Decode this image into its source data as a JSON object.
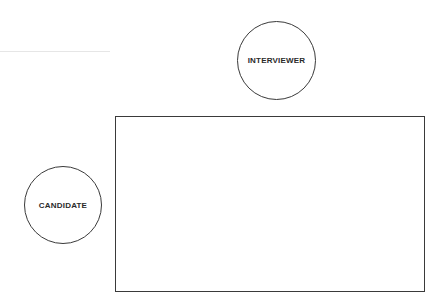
{
  "diagram": {
    "interviewer": {
      "label": "INTERVIEWER"
    },
    "candidate": {
      "label": "CANDIDATE"
    },
    "table": {
      "label": ""
    }
  }
}
